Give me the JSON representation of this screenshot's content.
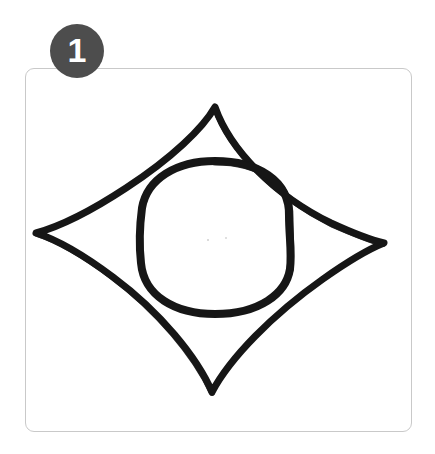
{
  "figure": {
    "background_color": "#ffffff"
  },
  "badge": {
    "number": "1",
    "fill_color": "#4d4d4d",
    "text_color": "#ffffff",
    "shape": "circle",
    "diameter_px": 54,
    "position": {
      "x": 50,
      "y": 24
    }
  },
  "card": {
    "border_color": "#c9c9c9",
    "background_color": "#ffffff",
    "corner_radius_px": 9,
    "bounds": {
      "x": 25,
      "y": 68,
      "width": 387,
      "height": 364
    }
  },
  "drawing": {
    "stroke_color": "#161616",
    "description": "hand-drawn concave diamond with a circle inside",
    "shapes": [
      {
        "name": "concave-diamond",
        "type": "astroid",
        "stroke_width_px": 7,
        "vertices": {
          "top": {
            "x": 215,
            "y": 107
          },
          "right": {
            "x": 384,
            "y": 243
          },
          "bottom": {
            "x": 212,
            "y": 392
          },
          "left": {
            "x": 36,
            "y": 233
          }
        }
      },
      {
        "name": "inner-circle",
        "type": "circle",
        "stroke_width_px": 8,
        "center": {
          "x": 215,
          "y": 237
        },
        "radius_px": 76
      }
    ]
  }
}
